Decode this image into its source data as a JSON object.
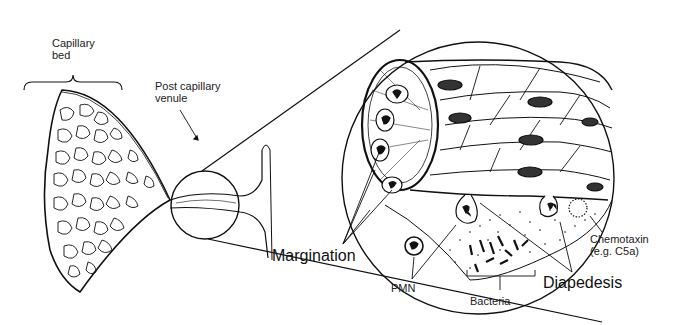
{
  "diagram": {
    "labels": {
      "capillary_bed": "Capillary\nbed",
      "capillary_bed_line1": "Capillary",
      "capillary_bed_line2": "bed",
      "post_capillary_venule_line1": "Post capillary",
      "post_capillary_venule_line2": "venule",
      "margination": "Margination",
      "pmn": "PMN",
      "bacteria": "Bacteria",
      "diapedesis": "Diapedesis",
      "chemotaxin_line1": "Chemotaxin",
      "chemotaxin_line2": "(e.g. C5a)"
    },
    "colors": {
      "ink": "#111111",
      "background": "#ffffff"
    }
  }
}
